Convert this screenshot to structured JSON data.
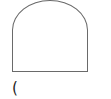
{
  "shape": {
    "type": "arch",
    "stroke": "#6a6a6a"
  },
  "caption": {
    "text": "("
  }
}
